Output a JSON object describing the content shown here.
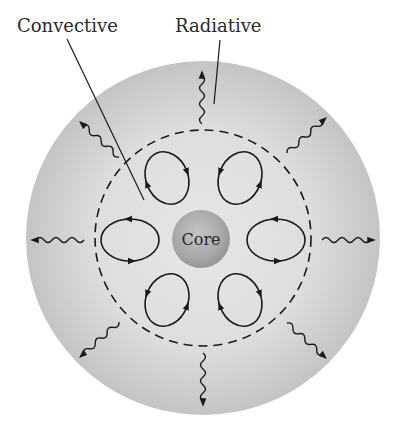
{
  "diagram": {
    "labels": {
      "convective": "Convective",
      "radiative": "Radiative",
      "core": "Core"
    },
    "colors": {
      "background": "#ffffff",
      "radiative_zone_outer": "#c4c4c4",
      "radiative_zone_inner": "#e2e2e2",
      "convective_zone": "#e4e4e4",
      "core_center": "#c2c2c2",
      "core_edge": "#9a9a9a",
      "line": "#1a1a1a"
    },
    "geometry": {
      "outer_circle": {
        "cx": 203,
        "cy": 238,
        "r": 177
      },
      "dashed_boundary": {
        "cx": 203,
        "cy": 238,
        "r": 108
      },
      "core": {
        "cx": 201,
        "cy": 239,
        "r": 29
      }
    },
    "convection_cells": [
      {
        "position": "upper-left",
        "cx": 167,
        "cy": 178,
        "rx": 21,
        "ry": 27,
        "rotate": -22
      },
      {
        "position": "upper-right",
        "cx": 240,
        "cy": 178,
        "rx": 21,
        "ry": 27,
        "rotate": 22
      },
      {
        "position": "left",
        "cx": 130,
        "cy": 240,
        "rx": 29,
        "ry": 21,
        "rotate": 0
      },
      {
        "position": "right",
        "cx": 276,
        "cy": 240,
        "rx": 29,
        "ry": 21,
        "rotate": 0
      },
      {
        "position": "lower-left",
        "cx": 167,
        "cy": 300,
        "rx": 21,
        "ry": 27,
        "rotate": 22
      },
      {
        "position": "lower-right",
        "cx": 240,
        "cy": 300,
        "rx": 21,
        "ry": 27,
        "rotate": -22
      }
    ],
    "radiation_arrows": [
      {
        "direction": "up"
      },
      {
        "direction": "up-right"
      },
      {
        "direction": "right"
      },
      {
        "direction": "down-right"
      },
      {
        "direction": "down"
      },
      {
        "direction": "down-left"
      },
      {
        "direction": "left"
      },
      {
        "direction": "up-left"
      }
    ]
  }
}
